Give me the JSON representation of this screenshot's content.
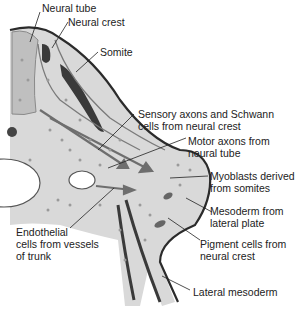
{
  "diagram": {
    "colors": {
      "tissue": "#d9d9d9",
      "neural_tube": "#bfbfbf",
      "dark": "#3a3a3a",
      "outline": "#2b2b2b",
      "arrow": "#6e6e6e",
      "text": "#222222"
    },
    "labels": [
      {
        "id": "neural-tube",
        "text": "Neural tube"
      },
      {
        "id": "neural-crest",
        "text": "Neural crest"
      },
      {
        "id": "somite",
        "text": "Somite"
      },
      {
        "id": "sensory-axons",
        "line1": "Sensory axons and Schwann",
        "line2": "cells from neural crest"
      },
      {
        "id": "motor-axons",
        "line1": "Motor axons from",
        "line2": "neural tube"
      },
      {
        "id": "myoblasts",
        "line1": "Myoblasts derived",
        "line2": "from somites"
      },
      {
        "id": "mesoderm-lateral",
        "line1": "Mesoderm from",
        "line2": "lateral plate"
      },
      {
        "id": "pigment-cells",
        "line1": "Pigment cells from",
        "line2": "neural crest"
      },
      {
        "id": "endothelial",
        "line1": "Endothelial",
        "line2": "cells from vessels",
        "line3": "of trunk"
      },
      {
        "id": "lateral-mesoderm",
        "text": "Lateral mesoderm"
      }
    ]
  }
}
